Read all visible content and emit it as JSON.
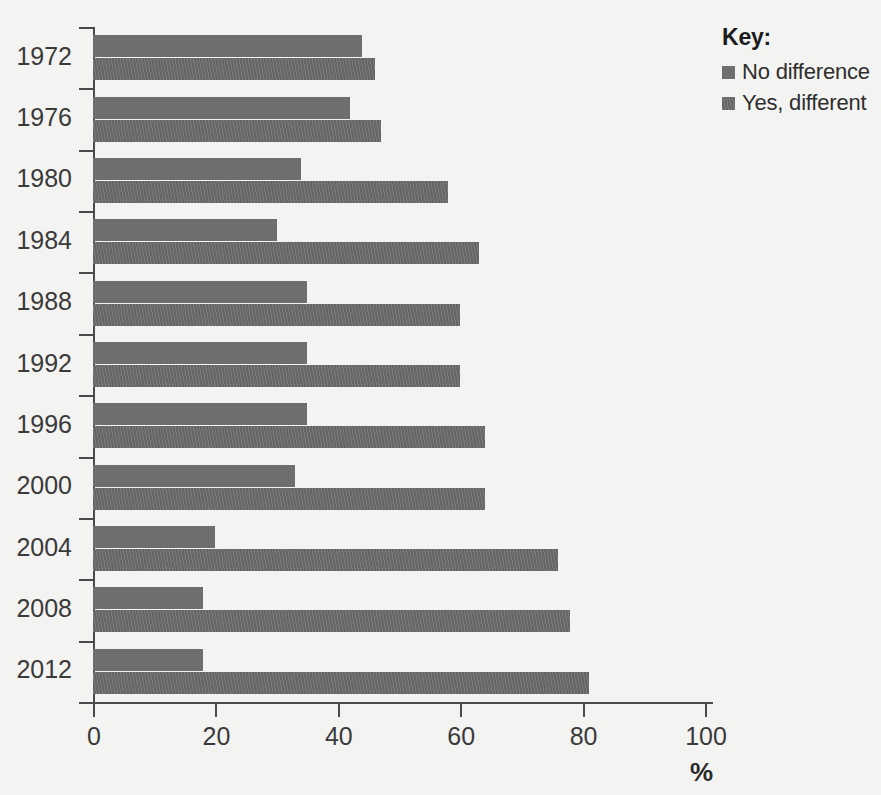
{
  "legend": {
    "title": "Key:",
    "entries": [
      {
        "label": "No difference",
        "color": "#6e6e6e"
      },
      {
        "label": "Yes, different",
        "color": "#666666"
      }
    ]
  },
  "axis": {
    "x_title": "%",
    "x_ticks": [
      "0",
      "20",
      "40",
      "60",
      "80",
      "100"
    ],
    "y_ticks": [
      "1972",
      "1976",
      "1980",
      "1984",
      "1988",
      "1992",
      "1996",
      "2000",
      "2004",
      "2008",
      "2012"
    ]
  },
  "chart_data": {
    "type": "bar",
    "orientation": "horizontal",
    "title": "",
    "subtitle": "",
    "xlabel": "%",
    "ylabel": "",
    "xlim": [
      0,
      100
    ],
    "xticks": [
      0,
      20,
      40,
      60,
      80,
      100
    ],
    "grid": false,
    "legend_position": "top-right",
    "legend_title": "Key:",
    "categories": [
      "1972",
      "1976",
      "1980",
      "1984",
      "1988",
      "1992",
      "1996",
      "2000",
      "2004",
      "2008",
      "2012"
    ],
    "series": [
      {
        "name": "No difference",
        "color": "#6e6e6e",
        "values": [
          44,
          42,
          34,
          30,
          35,
          35,
          35,
          33,
          20,
          18,
          18
        ]
      },
      {
        "name": "Yes, different",
        "color": "#666666",
        "values": [
          46,
          47,
          58,
          63,
          60,
          60,
          64,
          64,
          76,
          78,
          81
        ]
      }
    ]
  }
}
